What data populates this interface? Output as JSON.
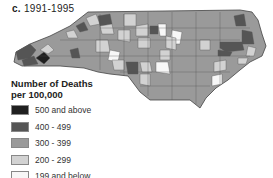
{
  "panel": {
    "letter": "c.",
    "period": "1991-1995"
  },
  "legend": {
    "title_line1": "Number of Deaths",
    "title_line2": "per 100,000",
    "items": [
      {
        "label": "500 and above",
        "color": "#1f1f1f"
      },
      {
        "label": "400 - 499",
        "color": "#555555"
      },
      {
        "label": "300 - 399",
        "color": "#9a9a9a"
      },
      {
        "label": "200 - 299",
        "color": "#d2d2d2"
      },
      {
        "label": "199 and below",
        "color": "#f7f7f7"
      }
    ]
  },
  "map": {
    "region": "North Carolina counties",
    "colors": {
      "c500": "#1f1f1f",
      "c400": "#555555",
      "c300": "#9a9a9a",
      "c200": "#d2d2d2",
      "c199": "#f7f7f7",
      "border": "#444444"
    }
  }
}
